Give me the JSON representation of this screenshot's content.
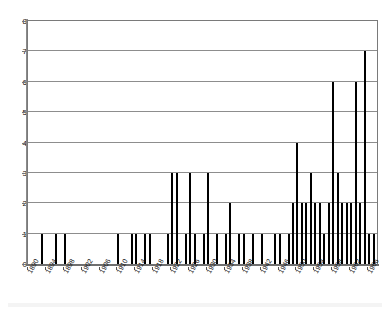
{
  "chart_data": {
    "type": "bar",
    "title": "",
    "subtitle": "",
    "xlabel": "",
    "ylabel": "",
    "grid": true,
    "legend": "none",
    "bar_color": "#000000",
    "axis_color": "#808080",
    "ylim": [
      0,
      8
    ],
    "y_ticks": [
      0,
      1,
      2,
      3,
      4,
      5,
      6,
      7,
      8
    ],
    "x_tick_labels": [
      "1890",
      "1894",
      "1898",
      "1902",
      "1906",
      "1910",
      "1914",
      "1918",
      "1922",
      "1926",
      "1930",
      "1934",
      "1938",
      "1942",
      "1946",
      "1950",
      "1954",
      "1958",
      "1962",
      "1966"
    ],
    "x_tick_step": 4,
    "xlim": [
      1890,
      1968
    ],
    "categories": [
      1890,
      1891,
      1892,
      1893,
      1894,
      1895,
      1896,
      1897,
      1898,
      1899,
      1900,
      1901,
      1902,
      1903,
      1904,
      1905,
      1906,
      1907,
      1908,
      1909,
      1910,
      1911,
      1912,
      1913,
      1914,
      1915,
      1916,
      1917,
      1918,
      1919,
      1920,
      1921,
      1922,
      1923,
      1924,
      1925,
      1926,
      1927,
      1928,
      1929,
      1930,
      1931,
      1932,
      1933,
      1934,
      1935,
      1936,
      1937,
      1938,
      1939,
      1940,
      1941,
      1942,
      1943,
      1944,
      1945,
      1946,
      1947,
      1948,
      1949,
      1950,
      1951,
      1952,
      1953,
      1954,
      1955,
      1956,
      1957,
      1958,
      1959,
      1960,
      1961,
      1962,
      1963,
      1964,
      1965,
      1966,
      1967
    ],
    "values": [
      0,
      0,
      0,
      1,
      0,
      0,
      1,
      0,
      1,
      0,
      0,
      0,
      0,
      0,
      0,
      0,
      0,
      0,
      0,
      0,
      1,
      0,
      0,
      1,
      1,
      0,
      1,
      1,
      0,
      0,
      0,
      1,
      3,
      3,
      0,
      1,
      3,
      1,
      0,
      1,
      3,
      0,
      1,
      0,
      1,
      2,
      0,
      1,
      1,
      0,
      1,
      0,
      1,
      0,
      0,
      1,
      1,
      0,
      1,
      2,
      4,
      2,
      2,
      3,
      2,
      2,
      1,
      2,
      6,
      3,
      2,
      2,
      2,
      6,
      2,
      7,
      1,
      1
    ]
  },
  "axes": {
    "y_axis_name": "count-axis",
    "x_axis_name": "year-axis"
  }
}
